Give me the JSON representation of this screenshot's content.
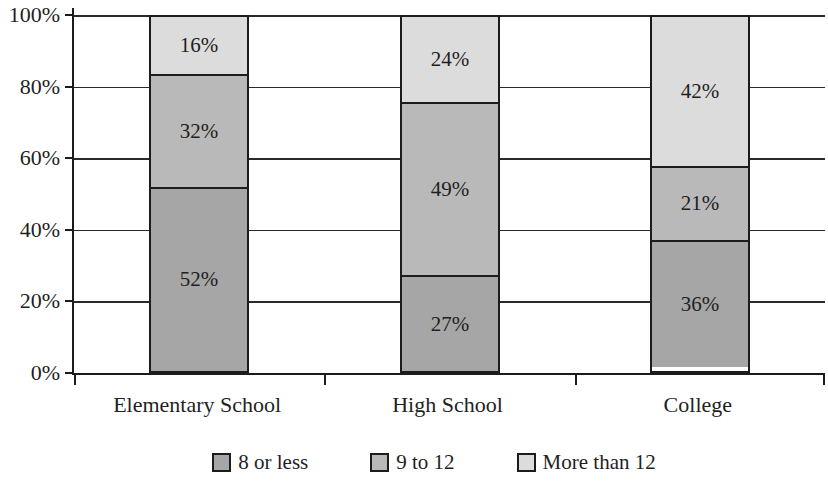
{
  "chart_data": {
    "type": "bar",
    "subtype": "stacked-100-column",
    "categories": [
      "Elementary School",
      "High School",
      "College"
    ],
    "series": [
      {
        "name": "8 or less",
        "values": [
          52,
          27,
          36
        ],
        "color": "#a6a6a6"
      },
      {
        "name": "9 to 12",
        "values": [
          32,
          49,
          21
        ],
        "color": "#b9b9b9"
      },
      {
        "name": "More than 12",
        "values": [
          16,
          24,
          42
        ],
        "color": "#dcdcdc"
      }
    ],
    "data_labels": [
      [
        "52%",
        "27%",
        "36%"
      ],
      [
        "32%",
        "49%",
        "21%"
      ],
      [
        "16%",
        "24%",
        "42%"
      ]
    ],
    "title": "",
    "xlabel": "",
    "ylabel": "",
    "ylim": [
      0,
      100
    ],
    "y_tick_step": 20,
    "y_tick_labels": [
      "0%",
      "20%",
      "40%",
      "60%",
      "80%",
      "100%"
    ],
    "value_suffix": "%",
    "grid": true,
    "legend_position": "bottom",
    "legend_labels": [
      "8 or less",
      "9 to 12",
      "More than 12"
    ]
  },
  "style_colors": {
    "axis": "#1c1c1c",
    "gridline": "#2a2a2a",
    "background": "#ffffff",
    "text": "#1f1f1f"
  }
}
